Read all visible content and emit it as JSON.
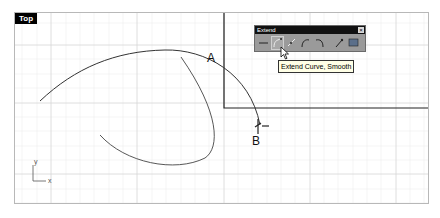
{
  "viewport": {
    "title": "Top",
    "grid_color": "#e4e4e4",
    "curve_color": "#333333"
  },
  "points": {
    "a_label": "A",
    "b_label": "B"
  },
  "axes": {
    "x_label": "x",
    "y_label": "y"
  },
  "toolbar": {
    "title": "Extend",
    "close_glyph": "×",
    "buttons": [
      {
        "name": "extend",
        "icon": "dash-icon"
      },
      {
        "name": "extend-curve-smooth",
        "icon": "curve-extend-smooth-icon",
        "active": true
      },
      {
        "name": "extend-line",
        "icon": "line-extend-icon"
      },
      {
        "name": "extend-arc",
        "icon": "arc-extend-icon"
      },
      {
        "name": "extend-arc-reverse",
        "icon": "arc-extend-reverse-icon"
      },
      {
        "name": "extend-by-line",
        "icon": "point-extend-icon"
      },
      {
        "name": "extend-surface",
        "icon": "surface-extend-icon"
      }
    ]
  },
  "tooltip": {
    "text": "Extend Curve, Smooth"
  }
}
